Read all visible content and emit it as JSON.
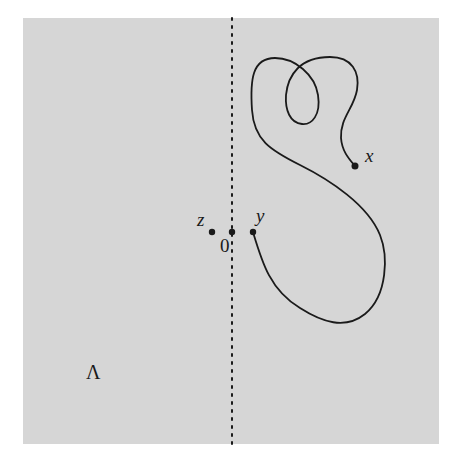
{
  "figure": {
    "region_label": "Λ",
    "axis": "vertical dashed line through origin",
    "points": [
      {
        "id": "z",
        "label": "z"
      },
      {
        "id": "origin",
        "label": "0"
      },
      {
        "id": "y",
        "label": "y"
      },
      {
        "id": "x",
        "label": "x"
      }
    ],
    "path_description": "curve from y to x"
  },
  "colors": {
    "background": "#ffffff",
    "region_fill": "#d6d6d6",
    "stroke": "#1a1a1a"
  }
}
